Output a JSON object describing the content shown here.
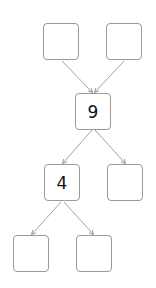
{
  "diagram": {
    "type": "factor-tree",
    "nodes": [
      {
        "id": "top-left",
        "value": ""
      },
      {
        "id": "top-right",
        "value": ""
      },
      {
        "id": "middle",
        "value": "9"
      },
      {
        "id": "mid-left",
        "value": "4"
      },
      {
        "id": "mid-right",
        "value": ""
      },
      {
        "id": "bottom-left",
        "value": ""
      },
      {
        "id": "bottom-right",
        "value": ""
      }
    ],
    "edges": [
      {
        "from": "top-left",
        "to": "middle"
      },
      {
        "from": "top-right",
        "to": "middle"
      },
      {
        "from": "middle",
        "to": "mid-left"
      },
      {
        "from": "middle",
        "to": "mid-right"
      },
      {
        "from": "mid-left",
        "to": "bottom-left"
      },
      {
        "from": "mid-left",
        "to": "bottom-right"
      }
    ],
    "colors": {
      "border": "#9a9a9a",
      "arrow": "#8a8a8a",
      "text": "#111111"
    }
  }
}
